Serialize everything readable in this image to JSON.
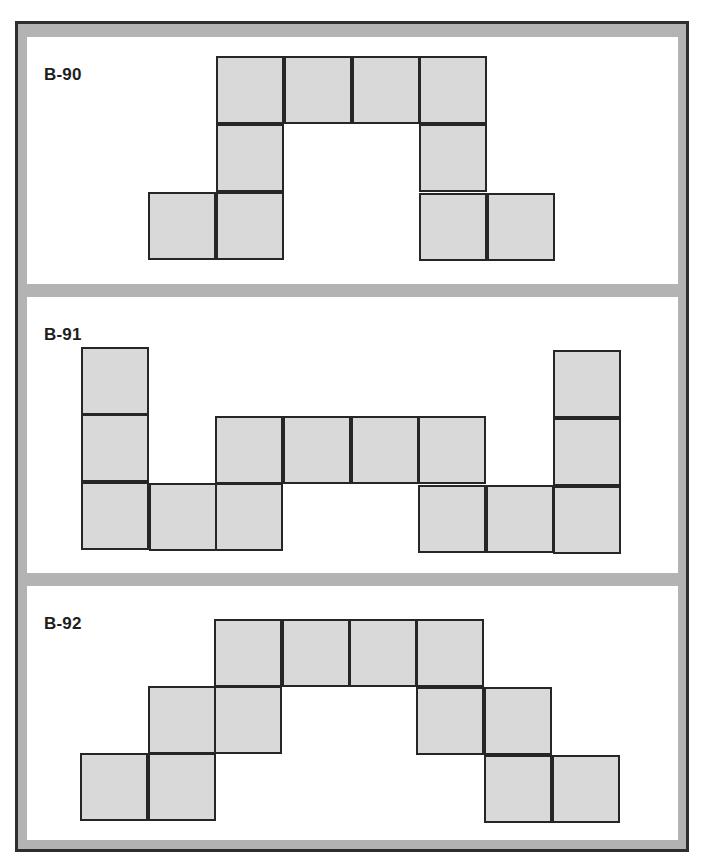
{
  "colors": {
    "frame_band": "#b3b3b3",
    "frame_line": "#2e2e2e",
    "square_fill": "#d9d9d9",
    "square_stroke": "#262626"
  },
  "panels": [
    {
      "label": "B-90",
      "left": 27,
      "top": 37,
      "width": 651,
      "height": 247,
      "squares": [
        [
          216,
          56
        ],
        [
          284,
          56
        ],
        [
          352,
          56
        ],
        [
          419,
          56
        ],
        [
          216,
          124
        ],
        [
          419,
          124
        ],
        [
          148,
          192
        ],
        [
          216,
          192
        ],
        [
          419,
          193
        ],
        [
          487,
          193
        ]
      ]
    },
    {
      "label": "B-91",
      "left": 27,
      "top": 297,
      "width": 651,
      "height": 276,
      "squares": [
        [
          81,
          347
        ],
        [
          81,
          414
        ],
        [
          81,
          482
        ],
        [
          149,
          483
        ],
        [
          215,
          416
        ],
        [
          283,
          416
        ],
        [
          351,
          416
        ],
        [
          418,
          416
        ],
        [
          215,
          483
        ],
        [
          418,
          485
        ],
        [
          486,
          485
        ],
        [
          553,
          350
        ],
        [
          553,
          418
        ],
        [
          553,
          486
        ]
      ]
    },
    {
      "label": "B-92",
      "left": 27,
      "top": 586,
      "width": 651,
      "height": 254,
      "squares": [
        [
          214,
          619
        ],
        [
          282,
          619
        ],
        [
          349,
          619
        ],
        [
          416,
          619
        ],
        [
          148,
          686
        ],
        [
          214,
          686
        ],
        [
          416,
          687
        ],
        [
          484,
          687
        ],
        [
          80,
          753
        ],
        [
          148,
          753
        ],
        [
          484,
          755
        ],
        [
          552,
          755
        ]
      ]
    }
  ]
}
